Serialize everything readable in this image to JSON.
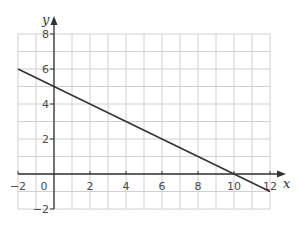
{
  "chart_data": {
    "type": "line",
    "title": "",
    "xlabel": "x",
    "ylabel": "y",
    "xlim": [
      -2,
      12
    ],
    "ylim": [
      -2,
      8
    ],
    "grid": true,
    "grid_step": 1,
    "x_ticks": [
      -2,
      0,
      2,
      4,
      6,
      8,
      10,
      12
    ],
    "y_ticks": [
      -2,
      2,
      4,
      6,
      8
    ],
    "x_tick_labels": [
      "−2",
      "0",
      "2",
      "4",
      "6",
      "8",
      "10",
      "12"
    ],
    "y_tick_labels": [
      "−2",
      "2",
      "4",
      "6",
      "8"
    ],
    "series": [
      {
        "name": "line",
        "equation": "y = 5 - x/2",
        "x": [
          -2,
          12
        ],
        "y": [
          6,
          -1
        ]
      }
    ],
    "colors": {
      "grid": "#d0d0d0",
      "axis": "#333333",
      "line": "#333333"
    }
  }
}
